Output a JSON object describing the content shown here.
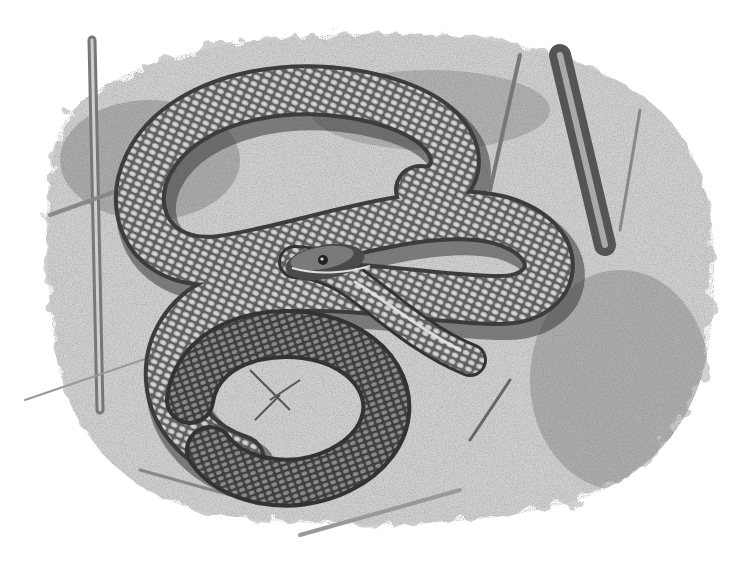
{
  "image": {
    "kind": "graphite illustration",
    "subject": "coiled snake on sandy ground",
    "caption": "",
    "palette": {
      "background": "#ffffff",
      "ground_light": "#d9d9d9",
      "ground_mid": "#9a9a9a",
      "ground_dark": "#5a5a5a",
      "snake_body": "#6e6e6e",
      "snake_dark": "#3a3a3a",
      "scale_highlight": "#cfcfcf",
      "stick": "#8a8a8a"
    }
  }
}
